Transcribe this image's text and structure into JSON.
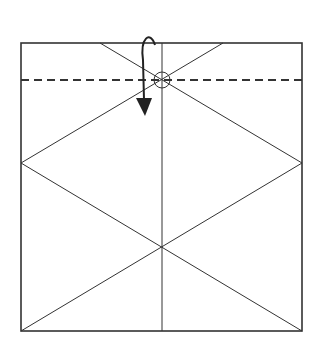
{
  "diagram": {
    "type": "origami-fold-step",
    "colors": {
      "line": "#333333",
      "background": "#ffffff"
    },
    "square": {
      "x1": 21,
      "y1": 43,
      "x2": 302,
      "y2": 331
    },
    "crease_lines": [
      {
        "name": "center-vertical",
        "x1": 162,
        "y1": 43,
        "x2": 162,
        "y2": 331
      },
      {
        "name": "top-left-diag",
        "x1": 100,
        "y1": 43,
        "x2": 302,
        "y2": 163
      },
      {
        "name": "top-right-diag",
        "x1": 223,
        "y1": 43,
        "x2": 21,
        "y2": 163
      },
      {
        "name": "left-lower-diag",
        "x1": 21,
        "y1": 163,
        "x2": 302,
        "y2": 331
      },
      {
        "name": "right-lower-diag",
        "x1": 302,
        "y1": 163,
        "x2": 21,
        "y2": 331
      }
    ],
    "valley_fold_line": {
      "x1": 21,
      "y1": 80,
      "x2": 302,
      "y2": 80
    },
    "reference_point": {
      "cx": 162,
      "cy": 80,
      "r": 8
    },
    "fold_arrow": {
      "direction": "down",
      "path": "M155 45 C150 30 140 38 143 60 L144 100"
    }
  }
}
